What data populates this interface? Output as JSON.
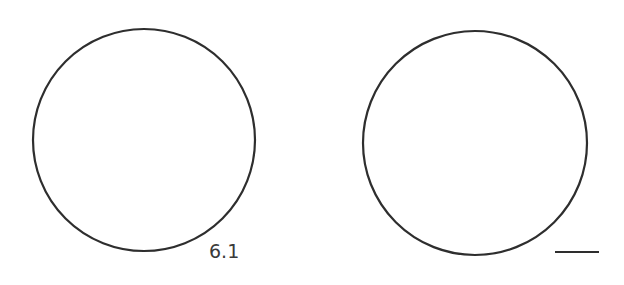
{
  "figure": {
    "background": "#ffffff",
    "stroke_color": "#2e2e2e",
    "left_circle": {
      "cx": 144,
      "cy": 140,
      "r": 111,
      "label": "6.1"
    },
    "right_circle": {
      "cx": 475,
      "cy": 143,
      "r": 112,
      "label": ""
    },
    "answer_blank": {
      "x1": 555,
      "y1": 252,
      "x2": 599,
      "y2": 252
    }
  }
}
